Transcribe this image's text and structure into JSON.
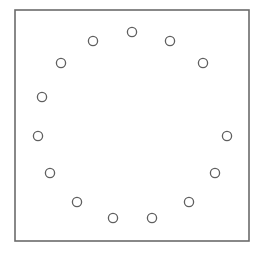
{
  "canvas": {
    "width": 261,
    "height": 254,
    "background": "#ffffff"
  },
  "frame": {
    "x": 15,
    "y": 10,
    "width": 234,
    "height": 231,
    "stroke": "#6b6b6b",
    "stroke_width": 1.6
  },
  "circle_style": {
    "radius": 4.6,
    "stroke": "#5f5f5f",
    "stroke_width": 1.3,
    "fill": "#ffffff"
  },
  "circles": [
    {
      "id": 1,
      "cx": 132,
      "cy": 32
    },
    {
      "id": 2,
      "cx": 170,
      "cy": 41
    },
    {
      "id": 3,
      "cx": 203,
      "cy": 63
    },
    {
      "id": 4,
      "cx": 227,
      "cy": 136
    },
    {
      "id": 5,
      "cx": 215,
      "cy": 173
    },
    {
      "id": 6,
      "cx": 189,
      "cy": 202
    },
    {
      "id": 7,
      "cx": 152,
      "cy": 218
    },
    {
      "id": 8,
      "cx": 113,
      "cy": 218
    },
    {
      "id": 9,
      "cx": 77,
      "cy": 202
    },
    {
      "id": 10,
      "cx": 50,
      "cy": 173
    },
    {
      "id": 11,
      "cx": 38,
      "cy": 136
    },
    {
      "id": 12,
      "cx": 42,
      "cy": 97
    },
    {
      "id": 13,
      "cx": 61,
      "cy": 63
    },
    {
      "id": 14,
      "cx": 93,
      "cy": 41
    }
  ]
}
